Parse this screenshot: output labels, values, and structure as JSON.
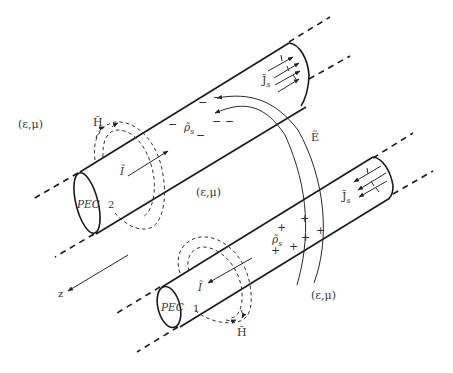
{
  "figure": {
    "media_label": "(ε,μ)",
    "conductors": [
      {
        "id": "2",
        "label": "PEC",
        "number": "2",
        "charge_label": "ρ̃",
        "charge_sub": "s",
        "charge_sign": "−",
        "current_label": "Ĩ",
        "surface_current_label": "J̃",
        "surface_current_sub": "s",
        "h_field_label": "H̃"
      },
      {
        "id": "1",
        "label": "PEC",
        "number": "1",
        "charge_label": "ρ̃",
        "charge_sub": "s",
        "charge_sign": "+",
        "current_label": "Ĩ",
        "surface_current_label": "J̃",
        "surface_current_sub": "s",
        "h_field_label": "H̃"
      }
    ],
    "e_field_label": "Ẽ",
    "axis_label": "z",
    "colors": {
      "ink": "#1a1a1a",
      "background": "#ffffff"
    }
  }
}
